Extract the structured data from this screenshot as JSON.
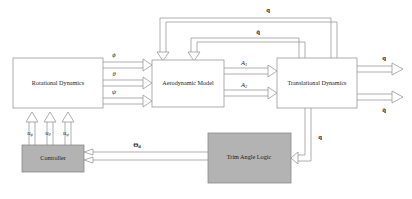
{
  "diagram": {
    "type": "block-diagram",
    "blocks": [
      {
        "id": "rotational",
        "label": "Rotational Dynamics",
        "fill": "#ffffff",
        "x": 13,
        "y": 58,
        "w": 90,
        "h": 50
      },
      {
        "id": "aerodynamic",
        "label": "Aerodynamic Model",
        "fill": "#ffffff",
        "x": 152,
        "y": 60,
        "w": 72,
        "h": 47
      },
      {
        "id": "translational",
        "label": "Translational Dynamics",
        "fill": "#ffffff",
        "x": 277,
        "y": 58,
        "w": 80,
        "h": 50
      },
      {
        "id": "controller",
        "label": "Controller",
        "fill": "#b3b3b3",
        "x": 22,
        "y": 145,
        "w": 62,
        "h": 27
      },
      {
        "id": "trim",
        "label": "Trim Angle Logic",
        "fill": "#b3b3b3",
        "x": 208,
        "y": 133,
        "w": 83,
        "h": 50
      }
    ],
    "signals": {
      "rot_to_aero": [
        {
          "name": "phi",
          "label": "ϕ",
          "x": 114,
          "y": 55
        },
        {
          "name": "theta",
          "label": "θ",
          "x": 114,
          "y": 74
        },
        {
          "name": "psi",
          "label": "ψ",
          "x": 114,
          "y": 92
        }
      ],
      "aero_to_trans": [
        {
          "name": "a1",
          "label": "A",
          "sub": "1",
          "x": 246,
          "y": 64
        },
        {
          "name": "a2",
          "label": "A",
          "sub": "2",
          "x": 246,
          "y": 85
        }
      ],
      "controller_inputs": [
        {
          "name": "u-phi",
          "label": "u",
          "sub": "ϕ",
          "x": 31,
          "y": 133
        },
        {
          "name": "u-theta",
          "label": "u",
          "sub": "θ",
          "x": 49,
          "y": 133
        },
        {
          "name": "u-psi",
          "label": "u",
          "sub": "ψ",
          "x": 67,
          "y": 133
        }
      ],
      "feedback_outer": {
        "name": "q",
        "label": "q",
        "x": 268,
        "y": 10
      },
      "feedback_inner": {
        "name": "q-dot",
        "label": "q̇",
        "x": 258,
        "y": 33
      },
      "output_top": {
        "name": "q",
        "label": "q",
        "x": 384,
        "y": 59
      },
      "output_bottom": {
        "name": "q-dot",
        "label": "q̇",
        "x": 384,
        "y": 110
      },
      "trim_feedback": {
        "name": "q",
        "label": "q",
        "x": 311,
        "y": 137
      },
      "theta_d": {
        "name": "theta-d",
        "label": "Θ",
        "sub": "d",
        "x": 137,
        "y": 145
      }
    },
    "colors": {
      "line": "#8c8c8c",
      "block_stroke": "#9a9a9a",
      "block_fill_white": "#ffffff",
      "block_fill_gray": "#b3b3b3",
      "text": "#1a1a1a",
      "background": "#ffffff"
    },
    "caption_fragment": ""
  }
}
